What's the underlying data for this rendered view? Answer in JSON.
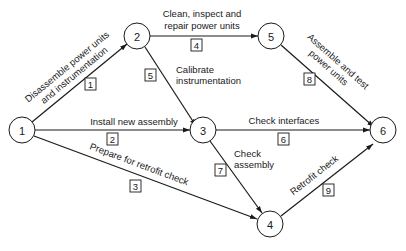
{
  "diagram": {
    "type": "activity-on-arrow network",
    "nodes": [
      {
        "id": "1",
        "label": "1"
      },
      {
        "id": "2",
        "label": "2"
      },
      {
        "id": "3",
        "label": "3"
      },
      {
        "id": "4",
        "label": "4"
      },
      {
        "id": "5",
        "label": "5"
      },
      {
        "id": "6",
        "label": "6"
      }
    ],
    "edges": [
      {
        "activity": "1",
        "from": "1",
        "to": "2",
        "label_line1": "Disassemble power units",
        "label_line2": "and instrumentation"
      },
      {
        "activity": "2",
        "from": "1",
        "to": "3",
        "label_line1": "Install new assembly"
      },
      {
        "activity": "3",
        "from": "1",
        "to": "4",
        "label_line1": "Prepare for retrofit check"
      },
      {
        "activity": "4",
        "from": "2",
        "to": "5",
        "label_line1": "Clean, inspect and",
        "label_line2": "repair power units"
      },
      {
        "activity": "5",
        "from": "2",
        "to": "3",
        "label_line1": "Calibrate",
        "label_line2": "instrumentation"
      },
      {
        "activity": "6",
        "from": "3",
        "to": "6",
        "label_line1": "Check interfaces"
      },
      {
        "activity": "7",
        "from": "3",
        "to": "4",
        "label_line1": "Check",
        "label_line2": "assembly"
      },
      {
        "activity": "8",
        "from": "5",
        "to": "6",
        "label_line1": "Assemble and test",
        "label_line2": "power units"
      },
      {
        "activity": "9",
        "from": "4",
        "to": "6",
        "label_line1": "Retrofit check"
      }
    ]
  }
}
